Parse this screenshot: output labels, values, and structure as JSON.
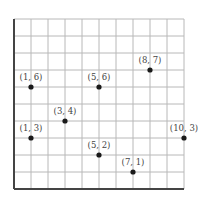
{
  "chart_data": {
    "type": "scatter",
    "title": "",
    "xlabel": "",
    "ylabel": "",
    "xlim": [
      0,
      10
    ],
    "ylim": [
      0,
      10
    ],
    "grid": true,
    "legend": null,
    "points": [
      {
        "x": 1,
        "y": 6,
        "label": "(1, 6)"
      },
      {
        "x": 5,
        "y": 6,
        "label": "(5, 6)"
      },
      {
        "x": 8,
        "y": 7,
        "label": "(8, 7)"
      },
      {
        "x": 3,
        "y": 4,
        "label": "(3, 4)"
      },
      {
        "x": 1,
        "y": 3,
        "label": "(1, 3)"
      },
      {
        "x": 10,
        "y": 3,
        "label": "(10, 3)"
      },
      {
        "x": 5,
        "y": 2,
        "label": "(5, 2)"
      },
      {
        "x": 7,
        "y": 1,
        "label": "(7, 1)"
      }
    ]
  },
  "layout": {
    "origin_px": [
      14,
      189
    ],
    "unit_px": 17,
    "grid_color": "#b8b8b8",
    "axis_color": "#444444",
    "point_color": "#1a1a1a"
  }
}
